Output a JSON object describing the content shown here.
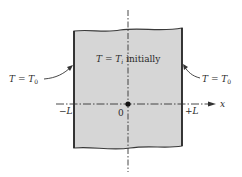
{
  "diagram": {
    "title_label": {
      "T": "T",
      "eq": " = ",
      "Ti": "T",
      "sub_i": "i",
      "suffix": " initially"
    },
    "left_boundary": {
      "T": "T",
      "eq": " = ",
      "T0": "T",
      "sub": "0"
    },
    "right_boundary": {
      "T": "T",
      "eq": " = ",
      "T0": "T",
      "sub": "0"
    },
    "axis": {
      "label": "x",
      "minus": "−L",
      "origin": "0",
      "plus": "+L"
    },
    "colors": {
      "slab_fill": "#d6d6d6",
      "slab_edge": "#3a3a3a",
      "line": "#333333"
    }
  }
}
